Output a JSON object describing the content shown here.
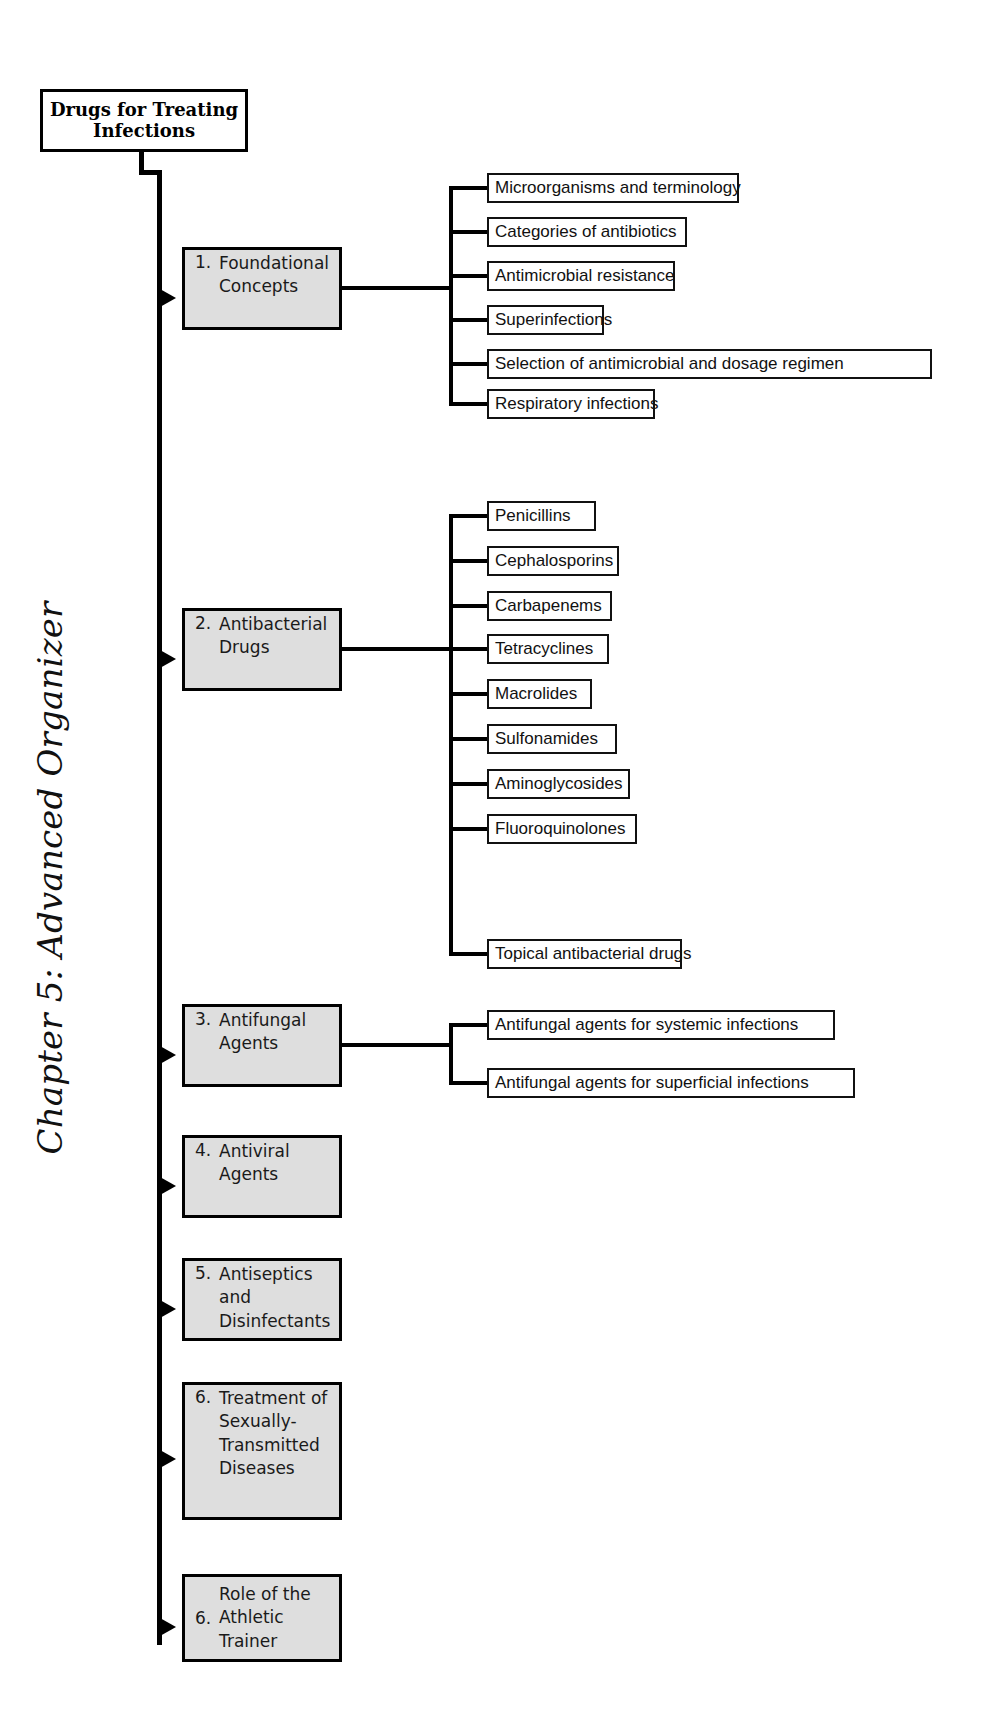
{
  "page": {
    "chapter_label": "Chapter 5: Advanced Organizer",
    "root_title_line1": "Drugs for Treating",
    "root_title_line2": "Infections",
    "colors": {
      "section_fill": "#dedede",
      "leaf_fill": "#ffffff",
      "line": "#000000",
      "text": "#111111",
      "background": "#ffffff"
    }
  },
  "sections": [
    {
      "number": "1.",
      "title": "Foundational Concepts",
      "title_line1": "Foundational",
      "title_line2": "Concepts",
      "children": [
        "Microorganisms and terminology",
        "Categories of antibiotics",
        "Antimicrobial resistance",
        "Superinfections",
        "Selection of antimicrobial and dosage regimen",
        "Respiratory infections"
      ]
    },
    {
      "number": "2.",
      "title": "Antibacterial Drugs",
      "title_line1": "Antibacterial",
      "title_line2": "Drugs",
      "children": [
        "Penicillins",
        "Cephalosporins",
        "Carbapenems",
        "Tetracyclines",
        "Macrolides",
        "Sulfonamides",
        "Aminoglycosides",
        "Fluoroquinolones",
        "Topical antibacterial drugs"
      ]
    },
    {
      "number": "3.",
      "title": "Antifungal Agents",
      "title_line1": "Antifungal",
      "title_line2": "Agents",
      "children": [
        "Antifungal agents for systemic infections",
        "Antifungal agents for superficial infections"
      ]
    },
    {
      "number": "4.",
      "title": "Antiviral Agents",
      "title_line1": "Antiviral",
      "title_line2": "Agents",
      "children": []
    },
    {
      "number": "5.",
      "title": "Antiseptics and Disinfectants",
      "title_line1": "Antiseptics and",
      "title_line2": "Disinfectants",
      "children": []
    },
    {
      "number": "6.",
      "title": "Treatment of Sexually-Transmitted Diseases",
      "title_line1": "Treatment of",
      "title_line2": "Sexually-",
      "title_line3": "Transmitted",
      "title_line4": "Diseases",
      "children": []
    },
    {
      "number": "6.",
      "title": "Role of the Athletic Trainer",
      "title_line1": "Role of the",
      "title_line2": "Athletic Trainer",
      "children": []
    }
  ]
}
